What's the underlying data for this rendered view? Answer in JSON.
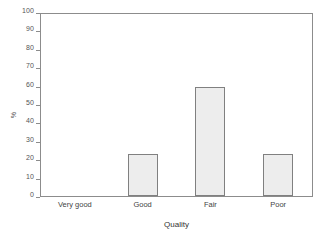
{
  "chart_data": {
    "type": "bar",
    "title": "",
    "categories": [
      "Very good",
      "Good",
      "Fair",
      "Poor"
    ],
    "values": [
      0,
      23,
      60,
      23
    ],
    "xlabel": "Quality",
    "ylabel": "%",
    "ylim": [
      0,
      100
    ],
    "yticks": [
      0,
      10,
      20,
      30,
      40,
      50,
      60,
      70,
      80,
      90,
      100
    ],
    "ytick_labels": [
      "0",
      "10",
      "20",
      "30",
      "40",
      "50",
      "60",
      "70",
      "80",
      "90",
      "100"
    ],
    "grid": false,
    "legend": null,
    "bar_fill_color": "#ededed",
    "bar_border_color": "#808080",
    "axis_color": "#8c8c8c",
    "background_color": "#ffffff"
  }
}
